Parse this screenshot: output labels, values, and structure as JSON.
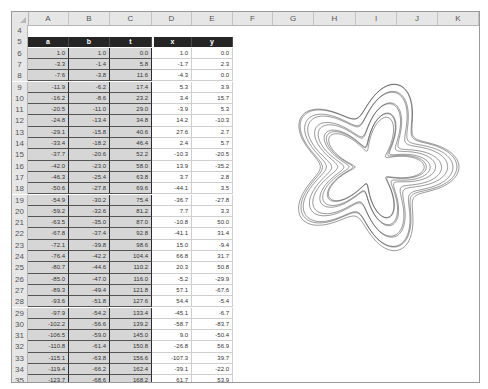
{
  "sheet": {
    "columns": [
      "A",
      "B",
      "C",
      "D",
      "E",
      "F",
      "G",
      "H",
      "I",
      "J",
      "K"
    ],
    "header_row": {
      "row": "5",
      "labels": [
        "a",
        "b",
        "t",
        "x",
        "y"
      ]
    },
    "blank_row": "4",
    "rows": [
      {
        "n": "6",
        "a": "1.0",
        "b": "1.0",
        "t": "0.0",
        "x": "1.0",
        "y": "0.0"
      },
      {
        "n": "7",
        "a": "-3.3",
        "b": "-1.4",
        "t": "5.8",
        "x": "-1.7",
        "y": "2.3"
      },
      {
        "n": "8",
        "a": "-7.6",
        "b": "-3.8",
        "t": "11.6",
        "x": "-4.3",
        "y": "0.0"
      },
      {
        "n": "9",
        "a": "-11.9",
        "b": "-6.2",
        "t": "17.4",
        "x": "5.3",
        "y": "3.9"
      },
      {
        "n": "10",
        "a": "-16.2",
        "b": "-8.6",
        "t": "23.2",
        "x": "3.4",
        "y": "15.7"
      },
      {
        "n": "11",
        "a": "-20.5",
        "b": "-11.0",
        "t": "29.0",
        "x": "-3.9",
        "y": "5.3"
      },
      {
        "n": "12",
        "a": "-24.8",
        "b": "-13.4",
        "t": "34.8",
        "x": "14.2",
        "y": "-10.3"
      },
      {
        "n": "13",
        "a": "-29.1",
        "b": "-15.8",
        "t": "40.6",
        "x": "27.6",
        "y": "2.7"
      },
      {
        "n": "14",
        "a": "-33.4",
        "b": "-18.2",
        "t": "46.4",
        "x": "2.4",
        "y": "5.7"
      },
      {
        "n": "15",
        "a": "-37.7",
        "b": "-20.6",
        "t": "52.2",
        "x": "-10.3",
        "y": "-20.5"
      },
      {
        "n": "16",
        "a": "-42.0",
        "b": "-23.0",
        "t": "58.0",
        "x": "13.9",
        "y": "-35.2"
      },
      {
        "n": "17",
        "a": "-46.3",
        "b": "-25.4",
        "t": "63.8",
        "x": "3.7",
        "y": "2.8"
      },
      {
        "n": "18",
        "a": "-50.6",
        "b": "-27.8",
        "t": "69.6",
        "x": "-44.1",
        "y": "3.5"
      },
      {
        "n": "19",
        "a": "-54.9",
        "b": "-30.2",
        "t": "75.4",
        "x": "-36.7",
        "y": "-27.8"
      },
      {
        "n": "20",
        "a": "-59.2",
        "b": "-32.6",
        "t": "81.2",
        "x": "7.7",
        "y": "3.3"
      },
      {
        "n": "21",
        "a": "-63.5",
        "b": "-35.0",
        "t": "87.0",
        "x": "-10.8",
        "y": "50.0"
      },
      {
        "n": "22",
        "a": "-67.8",
        "b": "-37.4",
        "t": "92.8",
        "x": "-41.1",
        "y": "31.4"
      },
      {
        "n": "23",
        "a": "-72.1",
        "b": "-39.8",
        "t": "98.6",
        "x": "15.0",
        "y": "-9.4"
      },
      {
        "n": "24",
        "a": "-76.4",
        "b": "-42.2",
        "t": "104.4",
        "x": "66.8",
        "y": "31.7"
      },
      {
        "n": "25",
        "a": "-80.7",
        "b": "-44.6",
        "t": "110.2",
        "x": "20.3",
        "y": "50.8"
      },
      {
        "n": "26",
        "a": "-85.0",
        "b": "-47.0",
        "t": "116.0",
        "x": "-5.2",
        "y": "-29.9"
      },
      {
        "n": "27",
        "a": "-89.3",
        "b": "-49.4",
        "t": "121.8",
        "x": "57.1",
        "y": "-67.6"
      },
      {
        "n": "28",
        "a": "-93.6",
        "b": "-51.8",
        "t": "127.6",
        "x": "54.4",
        "y": "-5.4"
      },
      {
        "n": "29",
        "a": "-97.9",
        "b": "-54.2",
        "t": "133.4",
        "x": "-45.1",
        "y": "-6.7"
      },
      {
        "n": "30",
        "a": "-102.2",
        "b": "-56.6",
        "t": "139.2",
        "x": "-58.7",
        "y": "-83.7"
      },
      {
        "n": "31",
        "a": "-106.5",
        "b": "-59.0",
        "t": "145.0",
        "x": "9.0",
        "y": "-50.4"
      },
      {
        "n": "32",
        "a": "-110.8",
        "b": "-61.4",
        "t": "150.8",
        "x": "-26.8",
        "y": "56.9"
      },
      {
        "n": "33",
        "a": "-115.1",
        "b": "-63.8",
        "t": "156.6",
        "x": "-107.3",
        "y": "39.7"
      },
      {
        "n": "34",
        "a": "-119.4",
        "b": "-66.2",
        "t": "162.4",
        "x": "-39.1",
        "y": "-22.0"
      },
      {
        "n": "35",
        "a": "-123.7",
        "b": "-68.6",
        "t": "168.2",
        "x": "61.7",
        "y": "53.9"
      }
    ]
  },
  "chart_data": {
    "type": "scatter",
    "title": "",
    "xlabel": "",
    "ylabel": "",
    "grid": false,
    "legend": "none",
    "style": "smooth line, no markers, 5-fold rose/spirograph pattern",
    "line_color": "#3a3a3a",
    "series": [
      {
        "name": "x vs y",
        "x": [
          1.0,
          -1.7,
          -4.3,
          5.3,
          3.4,
          -3.9,
          14.2,
          27.6,
          2.4,
          -10.3,
          13.9,
          3.7,
          -44.1,
          -36.7,
          7.7,
          -10.8,
          -41.1,
          15.0,
          66.8,
          20.3,
          -5.2,
          57.1,
          54.4,
          -45.1,
          -58.7,
          9.0,
          -26.8,
          -107.3,
          -39.1,
          61.7
        ],
        "y": [
          0.0,
          2.3,
          0.0,
          3.9,
          15.7,
          5.3,
          -10.3,
          2.7,
          5.7,
          -20.5,
          -35.2,
          2.8,
          3.5,
          -27.8,
          3.3,
          50.0,
          31.4,
          -9.4,
          31.7,
          50.8,
          -29.9,
          -67.6,
          -5.4,
          -6.7,
          -83.7,
          -50.4,
          56.9,
          39.7,
          -22.0,
          53.9
        ]
      }
    ]
  }
}
